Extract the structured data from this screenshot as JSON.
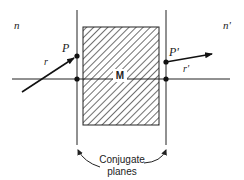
{
  "diagram": {
    "media": {
      "left": "n",
      "right": "n'"
    },
    "points": {
      "left": "P",
      "right": "P'"
    },
    "rays": {
      "incident": "r",
      "emergent": "r'"
    },
    "element_label": "M",
    "caption_line1": "Conjugate",
    "caption_line2": "planes"
  }
}
